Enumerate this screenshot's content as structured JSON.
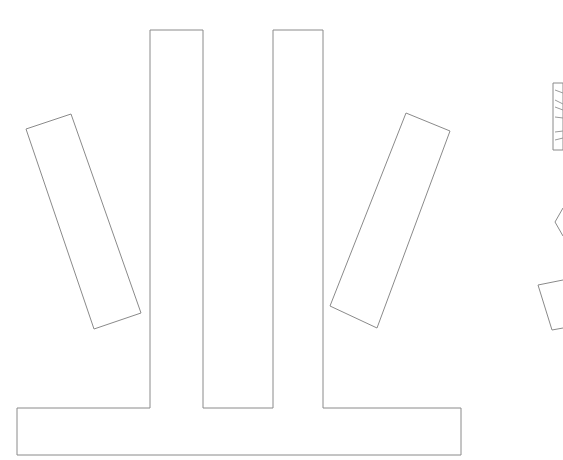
{
  "canvas": {
    "width": 563,
    "height": 460,
    "background": "#ffffff",
    "stroke_color": "#8a8a8a"
  },
  "shapes": {
    "main_frame": {
      "label": "T-base with two columns",
      "points": "17,408 150,408 150,30 203,30 203,408 273,408 273,30 323,30 323,408 461,408 461,455 17,455"
    },
    "left_tilted_rect": {
      "points": "26,129 71,114 141,313 94,329"
    },
    "right_tilted_rect": {
      "points": "406,113 450,131 377,328 330,306"
    },
    "edge_hatched_rect": {
      "points": "553,83 563,83 563,150 553,150"
    },
    "edge_chevron": {
      "points": "563,208 555,222 563,236"
    },
    "edge_quad": {
      "points": "563,280 538,285 552,330 563,328"
    }
  }
}
